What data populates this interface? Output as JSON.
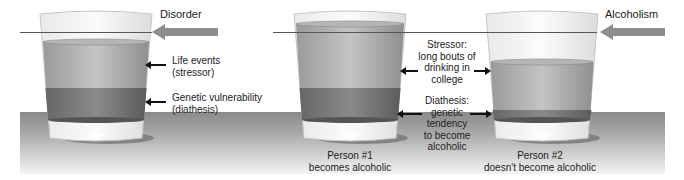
{
  "diagram": {
    "left_panel": {
      "threshold_label": "Disorder",
      "labels": {
        "stressor": [
          "Life events",
          "(stressor)"
        ],
        "diathesis": [
          "Genetic vulnerability",
          "(diathesis)"
        ]
      }
    },
    "right_panel": {
      "threshold_label": "Alcoholism",
      "middle_labels": {
        "stressor": [
          "Stressor:",
          "long bouts of",
          "drinking in",
          "college"
        ],
        "diathesis": [
          "Diathesis:",
          "genetic",
          "tendency",
          "to become",
          "alcoholic"
        ]
      },
      "person1": [
        "Person #1",
        "becomes alcoholic"
      ],
      "person2": [
        "Person #2",
        "doesn't become alcoholic"
      ]
    },
    "colors": {
      "stressor_layer": "#a8a8a8",
      "diathesis_layer": "#6f6f6f",
      "arrow": "#8d8d8d",
      "table": "#9a9a9a"
    }
  }
}
